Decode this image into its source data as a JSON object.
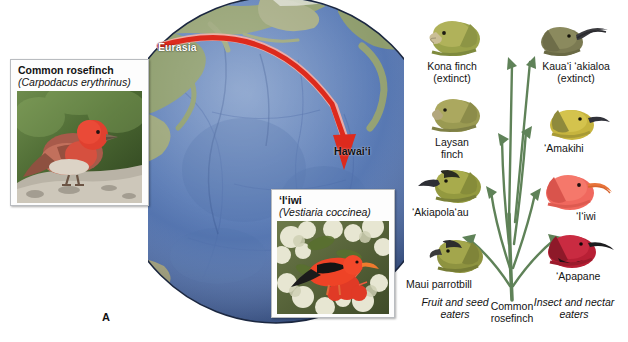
{
  "figure": {
    "panel_a_letter": "A",
    "panel_b_letter": "B"
  },
  "panel_a": {
    "name": "globe-colonization-map",
    "geo_labels": {
      "origin": "Eurasia",
      "destination": "Hawai‘i"
    },
    "arrow": {
      "name": "migration-arrow",
      "color": "#e02b20",
      "description": "curved red arrow from Eurasia to Hawai‘i"
    },
    "globe_colors": {
      "ocean": "#5a7bb4",
      "ocean_deep": "#43639f",
      "land": "#8d9a6a",
      "outline": "#1b2740"
    },
    "insets": [
      {
        "name": "common-rosefinch-inset",
        "common_name": "Common rosefinch",
        "scientific_name": "(Carpodacus erythrinus)",
        "photo_alt": "red rosefinch perched on a lichen-covered rock"
      },
      {
        "name": "iiwi-inset",
        "common_name": "‘I‘iwi",
        "scientific_name": "(Vestiaria coccinea)",
        "photo_alt": "scarlet ‘i‘iwi feeding on pale ‘ōhi‘a blossoms"
      }
    ]
  },
  "panel_b": {
    "name": "adaptive-radiation-diagram",
    "root": {
      "name": "common-rosefinch-root",
      "line1": "Common",
      "line2": "rosefinch"
    },
    "stem_color": "#5f8258",
    "diet_groups": [
      {
        "name": "fruit-and-seed-eaters",
        "line1": "Fruit and seed",
        "line2": "eaters",
        "side": "left"
      },
      {
        "name": "insect-and-nectar-eaters",
        "line1": "Insect and nectar",
        "line2": "eaters",
        "side": "right"
      }
    ],
    "descendants": [
      {
        "name": "kona-finch",
        "line1": "Kona finch",
        "line2": "(extinct)",
        "side": "left",
        "plumage": "#9aa24a",
        "bill": "#cbbf96",
        "bill_shape": "conical-thick"
      },
      {
        "name": "laysan-finch",
        "line1": "Laysan finch",
        "line2": "",
        "side": "left",
        "plumage": "#9a9a52",
        "bill": "#b3a77e",
        "bill_shape": "conical"
      },
      {
        "name": "akiapolaau",
        "line1": "‘Akiapola‘au",
        "line2": "",
        "side": "left",
        "plumage": "#93993f",
        "bill": "#2d2f35",
        "bill_shape": "long-decurved"
      },
      {
        "name": "maui-parrotbill",
        "line1": "Maui parrotbill",
        "line2": "",
        "side": "left",
        "plumage": "#8e9340",
        "bill": "#3a3a3a",
        "bill_shape": "hooked"
      },
      {
        "name": "kauai-akialoa",
        "line1": "Kaua‘i ‘akialoa",
        "line2": "(extinct)",
        "side": "right",
        "plumage": "#7b7a52",
        "bill": "#3b3b3f",
        "bill_shape": "very-long-decurved"
      },
      {
        "name": "amakihi",
        "line1": "‘Amakihi",
        "line2": "",
        "side": "right",
        "plumage": "#c6b43e",
        "bill": "#31323a",
        "bill_shape": "short-decurved"
      },
      {
        "name": "iiwi-head",
        "line1": "‘I‘iwi",
        "line2": "",
        "side": "right",
        "plumage": "#f0685e",
        "bill": "#e8743a",
        "bill_shape": "long-decurved"
      },
      {
        "name": "apapane",
        "line1": "‘Apapane",
        "line2": "",
        "side": "right",
        "plumage": "#b81f35",
        "bill": "#1d1d1f",
        "bill_shape": "short-decurved"
      }
    ]
  }
}
